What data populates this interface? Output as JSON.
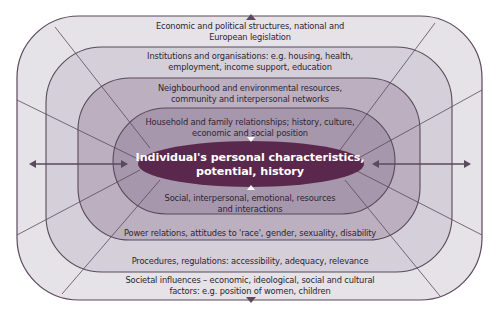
{
  "diagram": {
    "center": {
      "line1": "Individual's personal characteristics,",
      "line2": "potential, history"
    },
    "layers_top": [
      {
        "line1": "Household and family relationships; history, culture,",
        "line2": "economic and social position"
      },
      {
        "line1": "Neighbourhood and environmental resources,",
        "line2": "community and interpersonal networks"
      },
      {
        "line1": "Institutions and organisations: e.g. housing, health,",
        "line2": "employment, income support, education"
      },
      {
        "line1": "Economic and political structures, national and",
        "line2": "European legislation"
      }
    ],
    "layers_bottom": [
      {
        "line1": "Social, interpersonal, emotional, resources",
        "line2": "and interactions"
      },
      {
        "line1": "Power relations, attitudes to 'race', gender, sexuality, disability"
      },
      {
        "line1": "Procedures, regulations: accessibility, adequacy, relevance"
      },
      {
        "line1": "Societal influences – economic, ideological, social and cultural",
        "line2": "factors: e.g. position of women, children"
      }
    ],
    "colors": {
      "layer1": "#e5e2e8",
      "layer2": "#d5cfd9",
      "layer3": "#bcb0c0",
      "layer4": "#a797ac",
      "center": "#5b284d",
      "stroke": "#5a4a5c",
      "arrow": "#5a4a5c"
    }
  }
}
